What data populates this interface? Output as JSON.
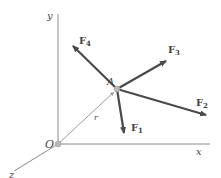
{
  "diagram": {
    "colors": {
      "axis": "#8a8a8a",
      "force": "#4a4a4a",
      "position_vector": "#9a9a9a",
      "point": "#b0b0b0",
      "label": "#444444"
    },
    "axes": {
      "x": {
        "label": "x"
      },
      "y": {
        "label": "y"
      },
      "z": {
        "label": "z"
      },
      "origin": {
        "label": "O"
      }
    },
    "point": {
      "label": "A"
    },
    "position_vector": {
      "label": "r"
    },
    "forces": [
      {
        "name": "F",
        "sub": "1"
      },
      {
        "name": "F",
        "sub": "2"
      },
      {
        "name": "F",
        "sub": "3"
      },
      {
        "name": "F",
        "sub": "4"
      }
    ]
  }
}
